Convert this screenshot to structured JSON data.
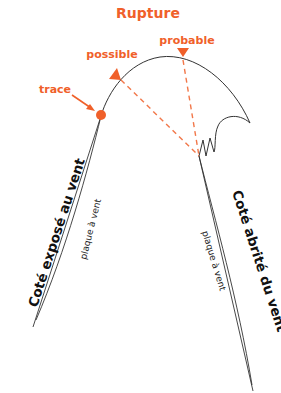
{
  "title": "Rupture",
  "labels": {
    "possible": "possible",
    "probable": "probable",
    "trace": "trace",
    "windward_side": "Coté exposé au vent",
    "leeward_side": "Coté abrité du vent",
    "slab_left": "plaque à vent",
    "slab_right": "plaque à vent"
  },
  "colors": {
    "accent": "#f0602a",
    "line": "#333333",
    "text": "#111111",
    "background": "#ffffff"
  }
}
